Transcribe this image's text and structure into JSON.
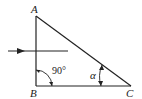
{
  "diagram": {
    "type": "right-triangle",
    "vertices": {
      "A": {
        "label": "A"
      },
      "B": {
        "label": "B"
      },
      "C": {
        "label": "C"
      }
    },
    "angles": {
      "B": {
        "label": "90°"
      },
      "C": {
        "label": "α"
      }
    },
    "incident_ray": {
      "direction": "left-to-right",
      "crosses": "AB"
    },
    "colors": {
      "stroke": "#222222",
      "background": "#ffffff"
    }
  }
}
